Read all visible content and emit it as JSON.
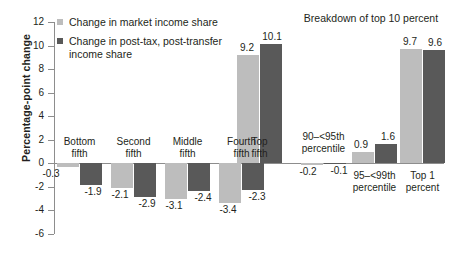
{
  "chart_data": {
    "type": "bar",
    "title": "",
    "xlabel": "",
    "ylabel": "Percentage-point change",
    "ylim": [
      -6,
      12
    ],
    "yticks": [
      -6,
      -4,
      -2,
      0,
      2,
      4,
      6,
      8,
      10,
      12
    ],
    "grid": false,
    "legend_position": "top-left",
    "annotations": [
      "Breakdown of top 10 percent"
    ],
    "categories": [
      "Bottom fifth",
      "Second fifth",
      "Middle fifth",
      "Fourth fifth",
      "Top fifth",
      "90–<95th percentile",
      "95–<99th percentile",
      "Top 1 percent"
    ],
    "series": [
      {
        "name": "Change in market income share",
        "color": "#bdbdbd",
        "values": [
          -0.3,
          -2.1,
          -3.1,
          -3.4,
          9.2,
          -0.2,
          0.9,
          9.7
        ]
      },
      {
        "name": "Change in post-tax, post-transfer income share",
        "color": "#595959",
        "values": [
          -1.9,
          -2.9,
          -2.4,
          -2.3,
          10.1,
          -0.1,
          1.6,
          9.6
        ]
      }
    ]
  },
  "axis": {
    "y_title": "Percentage-point change",
    "ticks": [
      {
        "label": "12",
        "value": 12
      },
      {
        "label": "10",
        "value": 10
      },
      {
        "label": "8",
        "value": 8
      },
      {
        "label": "6",
        "value": 6
      },
      {
        "label": "4",
        "value": 4
      },
      {
        "label": "2",
        "value": 2
      },
      {
        "label": "0",
        "value": 0
      },
      {
        "label": "-2",
        "value": -2
      },
      {
        "label": "-4",
        "value": -4
      },
      {
        "label": "-6",
        "value": -6
      }
    ]
  },
  "legend": {
    "items": [
      {
        "marker": "light-square-marker",
        "label": "Change in market income share",
        "line1": "Change in market income share",
        "line2": ""
      },
      {
        "marker": "dark-square-marker",
        "label": "Change in post-tax, post-transfer income share",
        "line1": "Change in post-tax, post-transfer",
        "line2": "income share"
      }
    ]
  },
  "annotations": {
    "breakdown_header": "Breakdown of top 10 percent"
  },
  "groups": [
    {
      "name": "bottom-fifth",
      "line1": "Bottom",
      "line2": "fifth",
      "light": "-0.3",
      "dark": "-1.9"
    },
    {
      "name": "second-fifth",
      "line1": "Second",
      "line2": "fifth",
      "light": "-2.1",
      "dark": "-2.9"
    },
    {
      "name": "middle-fifth",
      "line1": "Middle",
      "line2": "fifth",
      "light": "-3.1",
      "dark": "-2.4"
    },
    {
      "name": "fourth-fifth",
      "line1": "Fourth",
      "line2": "fifth",
      "light": "-3.4",
      "dark": "-2.3"
    },
    {
      "name": "top-fifth",
      "line1": "Top",
      "line2": "fifth",
      "light": "9.2",
      "dark": "10.1"
    },
    {
      "name": "p90-p95",
      "line1": "90–<95th",
      "line2": "percentile",
      "light": "-0.2",
      "dark": "-0.1"
    },
    {
      "name": "p95-p99",
      "line1": "95–<99th",
      "line2": "percentile",
      "light": "0.9",
      "dark": "1.6"
    },
    {
      "name": "top-1-percent",
      "line1": "Top 1",
      "line2": "percent",
      "light": "9.7",
      "dark": "9.6"
    }
  ]
}
